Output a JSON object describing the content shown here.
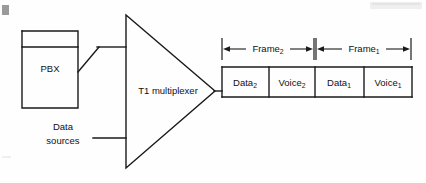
{
  "figure": {
    "background_color": "#fefefe",
    "line_color": "#1a1a1a",
    "text_color": "#111111"
  },
  "nodes": {
    "pbx": {
      "label": "PBX",
      "shape": "rectangle"
    },
    "data_sources": {
      "label_line1": "Data",
      "label_line2": "sources",
      "shape": "text-only"
    },
    "multiplexer": {
      "label": "T1 multiplexer",
      "shape": "triangle"
    }
  },
  "frames": [
    {
      "label": "Frame",
      "subscript": "2"
    },
    {
      "label": "Frame",
      "subscript": "1"
    }
  ],
  "slots": [
    {
      "label": "Data",
      "subscript": "2"
    },
    {
      "label": "Voice",
      "subscript": "2"
    },
    {
      "label": "Data",
      "subscript": "1"
    },
    {
      "label": "Voice",
      "subscript": "1"
    }
  ],
  "artifacts": {
    "corner_mark": "gray-square",
    "top_right_smudge": "light-band"
  }
}
